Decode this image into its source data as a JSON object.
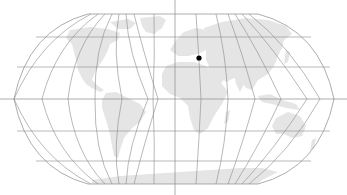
{
  "map": {
    "projection": "Robinson",
    "background_color": "#ffffff",
    "land_color": "#e5e5e5",
    "graticule_color": "#8a8a8a",
    "marker_color": "#000000",
    "marker": {
      "label": "location-marker",
      "x": 199,
      "y": 58,
      "radius": 2.6
    },
    "crosshair": {
      "vertical_x": 175,
      "horizontal_y": 99
    },
    "parallels_y": [
      14,
      37,
      67,
      99,
      131,
      161,
      184
    ],
    "meridians_count": 24
  }
}
